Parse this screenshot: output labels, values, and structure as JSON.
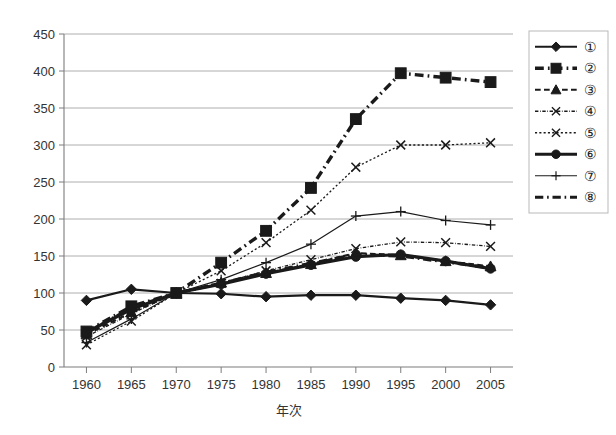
{
  "chart_data": {
    "type": "line",
    "title": "",
    "xlabel": "年次",
    "ylabel": "",
    "xlim": [
      1957.5,
      2007.5
    ],
    "ylim": [
      0,
      450
    ],
    "grid": true,
    "legend_position": "right",
    "x": [
      1960,
      1965,
      1970,
      1975,
      1980,
      1985,
      1990,
      1995,
      2000,
      2005
    ],
    "categories": [
      "1960",
      "1965",
      "1970",
      "1975",
      "1980",
      "1985",
      "1990",
      "1995",
      "2000",
      "2005"
    ],
    "ytick_labels": [
      "0",
      "50",
      "100",
      "150",
      "200",
      "250",
      "300",
      "350",
      "400",
      "450"
    ],
    "yticks": [
      0,
      50,
      100,
      150,
      200,
      250,
      300,
      350,
      400,
      450
    ],
    "series": [
      {
        "name": "①",
        "marker": "diamond",
        "linestyle": "solid",
        "linewidth": 2.2,
        "values": [
          90,
          105,
          100,
          99,
          95,
          97,
          97,
          93,
          90,
          84
        ]
      },
      {
        "name": "②",
        "marker": "square",
        "linestyle": "dashdot",
        "linewidth": 3.4,
        "values": [
          48,
          82,
          100,
          141,
          184,
          242,
          335,
          397,
          391,
          385
        ]
      },
      {
        "name": "③",
        "marker": "triangle",
        "linestyle": "dashed",
        "linewidth": 2.2,
        "values": [
          44,
          74,
          100,
          114,
          127,
          139,
          154,
          151,
          143,
          136
        ]
      },
      {
        "name": "④",
        "marker": "x",
        "linestyle": "dashdot",
        "linewidth": 1.3,
        "values": [
          41,
          72,
          100,
          113,
          130,
          145,
          160,
          169,
          168,
          163
        ]
      },
      {
        "name": "⑤",
        "marker": "x",
        "linestyle": "dotted",
        "linewidth": 1.3,
        "values": [
          30,
          62,
          100,
          130,
          168,
          212,
          270,
          300,
          300,
          303
        ]
      },
      {
        "name": "⑥",
        "marker": "circle",
        "linestyle": "solid",
        "linewidth": 3.2,
        "values": [
          47,
          78,
          100,
          112,
          126,
          138,
          149,
          152,
          143,
          133
        ]
      },
      {
        "name": "⑦",
        "marker": "plus",
        "linestyle": "solid",
        "linewidth": 1.2,
        "values": [
          33,
          65,
          100,
          118,
          141,
          166,
          204,
          210,
          198,
          192
        ]
      },
      {
        "name": "⑧",
        "marker": "none",
        "linestyle": "dashdot",
        "linewidth": 3.2,
        "values": [
          46,
          80,
          100,
          113,
          128,
          140,
          152,
          150,
          142,
          134
        ]
      }
    ]
  },
  "legend": {
    "items": [
      {
        "label": "①"
      },
      {
        "label": "②"
      },
      {
        "label": "③"
      },
      {
        "label": "④"
      },
      {
        "label": "⑤"
      },
      {
        "label": "⑥"
      },
      {
        "label": "⑦"
      },
      {
        "label": "⑧"
      }
    ]
  },
  "colors": {
    "line": "#1a1a1a",
    "grid": "#9a9a9a",
    "axis": "#7d7d7d",
    "text": "#333333",
    "background": "#ffffff"
  }
}
